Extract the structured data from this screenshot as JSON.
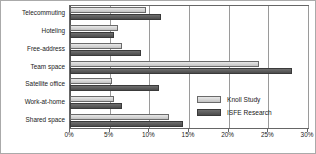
{
  "chart_data": {
    "type": "bar",
    "orientation": "horizontal",
    "title": "",
    "subtitle": "",
    "xlabel": "",
    "ylabel": "",
    "xlim": [
      0,
      30
    ],
    "xticks": [
      0,
      5,
      10,
      15,
      20,
      25,
      30
    ],
    "xtick_labels": [
      "0%",
      "5%",
      "10%",
      "15%",
      "20%",
      "25%",
      "30%"
    ],
    "grid": true,
    "grid_axis": "x",
    "legend_position": "inside-lower-right",
    "value_unit": "%",
    "categories": [
      "Telecommuting",
      "Hoteling",
      "Free-address",
      "Team space",
      "Satellite office",
      "Work-at-home",
      "Shared space"
    ],
    "series": [
      {
        "name": "Knoll Study",
        "color": "#d2d2d2",
        "values": [
          9.6,
          6.0,
          6.5,
          23.8,
          5.3,
          5.5,
          12.5
        ]
      },
      {
        "name": "ISFE Research",
        "color": "#5a5a5a",
        "values": [
          11.5,
          5.5,
          9.0,
          28.0,
          11.2,
          6.5,
          14.3
        ]
      }
    ]
  },
  "legend": {
    "items": [
      {
        "label": "Knoll Study"
      },
      {
        "label": "ISFE Research"
      }
    ]
  }
}
